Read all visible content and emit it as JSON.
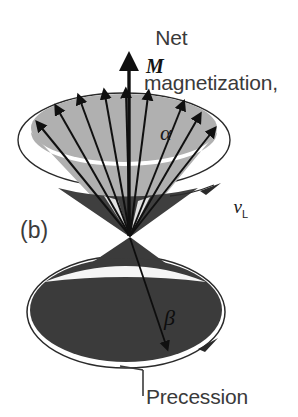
{
  "figure": {
    "panel_label": "(b)",
    "title_line1": "Net",
    "title_line2": "magnetization,",
    "vector_symbol": "M",
    "cone_angle_upper": "α",
    "cone_angle_lower": "β",
    "larmor_symbol": "ν",
    "larmor_subscript": "L",
    "bottom_caption": "Precession",
    "colors": {
      "background": "#ffffff",
      "upper_cone_fill": "#b0b0b0",
      "lower_cone_fill": "#3b3b3b",
      "cone_shadow": "#4a4a4a",
      "outline": "#2a2a2a",
      "arrow": "#101010",
      "text": "#3a3a3a"
    },
    "geometry": {
      "apex_x": 130,
      "apex_y": 237,
      "upper_ellipse_cx": 124,
      "upper_ellipse_cy": 128,
      "upper_ellipse_rx": 93,
      "upper_ellipse_ry": 34,
      "lower_ellipse_cx": 126,
      "lower_ellipse_cy": 312,
      "lower_ellipse_rx": 99,
      "lower_ellipse_ry": 56,
      "spin_arrow_count": 9,
      "net_arrow_tip_y": 60
    }
  }
}
